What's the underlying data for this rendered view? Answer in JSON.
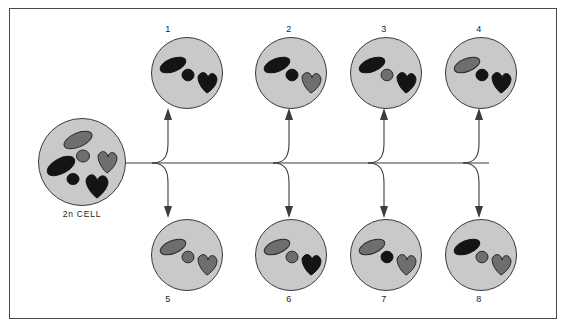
{
  "diagram": {
    "parent_cell": {
      "label": "2n  CELL",
      "chromosome_count": 6,
      "pair_count": 3,
      "chromosomes": [
        {
          "shape": "rod",
          "color": "gray"
        },
        {
          "shape": "rod",
          "color": "black"
        },
        {
          "shape": "dot",
          "color": "gray"
        },
        {
          "shape": "dot",
          "color": "black"
        },
        {
          "shape": "chevron",
          "color": "gray"
        },
        {
          "shape": "chevron",
          "color": "black"
        }
      ]
    },
    "colors": {
      "maternal": "#6e6e6e",
      "paternal": "#141414",
      "cell_fill": "#c9c9c9",
      "cell_stroke": "#3a3a3a",
      "frame_stroke": "#4a4a4a",
      "page_background": "#ffffff"
    },
    "gametes": [
      {
        "label": "1",
        "row": "top",
        "rod": "black",
        "dot": "black",
        "chevron": "black"
      },
      {
        "label": "2",
        "row": "top",
        "rod": "black",
        "dot": "black",
        "chevron": "gray"
      },
      {
        "label": "3",
        "row": "top",
        "rod": "black",
        "dot": "gray",
        "chevron": "black"
      },
      {
        "label": "4",
        "row": "top",
        "rod": "gray",
        "dot": "black",
        "chevron": "black"
      },
      {
        "label": "5",
        "row": "bottom",
        "rod": "gray",
        "dot": "gray",
        "chevron": "gray"
      },
      {
        "label": "6",
        "row": "bottom",
        "rod": "gray",
        "dot": "gray",
        "chevron": "black"
      },
      {
        "label": "7",
        "row": "bottom",
        "rod": "gray",
        "dot": "black",
        "chevron": "gray"
      },
      {
        "label": "8",
        "row": "bottom",
        "rod": "black",
        "dot": "gray",
        "chevron": "gray"
      }
    ]
  }
}
